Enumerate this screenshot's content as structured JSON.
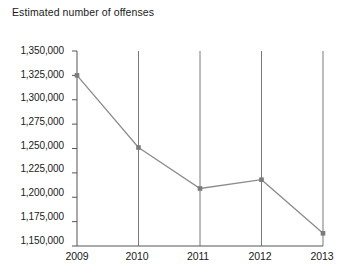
{
  "chart_data": {
    "type": "line",
    "title": "",
    "ylabel_lines": [
      "Estimated",
      "number of offenses"
    ],
    "ylabel": "Estimated number of offenses",
    "xlabel": "",
    "categories": [
      "2009",
      "2010",
      "2011",
      "2012",
      "2013"
    ],
    "x": [
      2009,
      2010,
      2011,
      2012,
      2013
    ],
    "values": [
      1325000,
      1251000,
      1209000,
      1218000,
      1163000
    ],
    "series": [
      {
        "name": "Estimated number of offenses",
        "values": [
          1325000,
          1251000,
          1209000,
          1218000,
          1163000
        ]
      }
    ],
    "ylim": [
      1150000,
      1350000
    ],
    "yticks": [
      1350000,
      1325000,
      1300000,
      1275000,
      1250000,
      1225000,
      1200000,
      1175000,
      1150000
    ],
    "ytick_labels": [
      "1,350,000",
      "1,325,000",
      "1,300,000",
      "1,275,000",
      "1,250,000",
      "1,225,000",
      "1,200,000",
      "1,175,000",
      "1,150,000"
    ],
    "xtick_labels": [
      "2009",
      "2010",
      "2011",
      "2012",
      "2013"
    ],
    "grid": "vertical",
    "legend": "none",
    "marker": "square",
    "colors": {
      "line": "#8c8c8c",
      "marker": "#7a7a7a",
      "axis": "#555555",
      "gridline": "#7a7a7a",
      "text": "#1a1a1a",
      "background": "#ffffff"
    }
  }
}
